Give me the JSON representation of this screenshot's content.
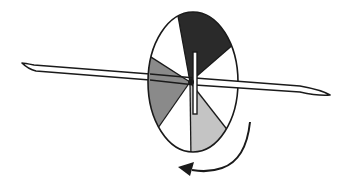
{
  "diagram": {
    "title": "",
    "disk": {
      "sectors": [
        {
          "name": "dark-sector",
          "fill": "#2a2a2a"
        },
        {
          "name": "white-sector-1",
          "fill": "#ffffff"
        },
        {
          "name": "light-sector",
          "fill": "#c4c4c4"
        },
        {
          "name": "white-sector-2",
          "fill": "#ffffff"
        },
        {
          "name": "medium-sector",
          "fill": "#8a8a8a"
        },
        {
          "name": "white-sector-3",
          "fill": "#ffffff"
        }
      ],
      "outline_color": "#1a1a1a"
    },
    "spindle": {
      "color": "#1a1a1a"
    },
    "rotation_arrow": {
      "direction": "counterclockwise-downward",
      "color": "#1a1a1a"
    }
  }
}
